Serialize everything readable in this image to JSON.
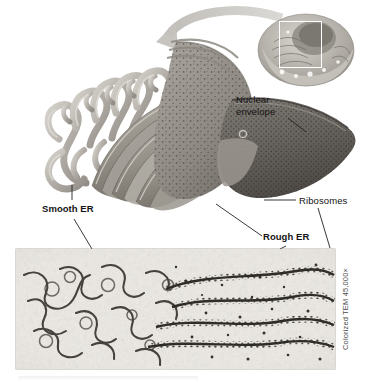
{
  "figure": {
    "type": "biology-illustration",
    "labels": {
      "nuclear_envelope": "Nuclear\nenvelope",
      "ribosomes": "Ribosomes",
      "smooth_er": "Smooth ER",
      "rough_er": "Rough ER"
    },
    "micrograph": {
      "credit": "Colorized TEM 45,000×",
      "magnification": "45,000×",
      "technique": "Colorized TEM"
    },
    "inset": {
      "name": "cell-cutaway-inset",
      "selection_box": "region-of-interest"
    },
    "arrow": {
      "name": "zoom-in-arrow",
      "direction": "from inset to enlarged view"
    },
    "colors": {
      "smooth_er": "#b9b5ae",
      "rough_er": "#8e8a84",
      "nuclear_envelope": "#6e6a65",
      "arrow": "#c9c6c1",
      "micrograph_bg": "#efece6",
      "label_text": "#141414",
      "credit_text": "#4a4a4a"
    }
  }
}
